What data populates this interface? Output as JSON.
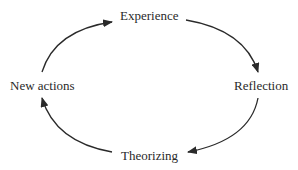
{
  "diagram": {
    "type": "cycle",
    "nodes": [
      {
        "id": "experience",
        "label": "Experience"
      },
      {
        "id": "reflection",
        "label": "Reflection"
      },
      {
        "id": "theorizing",
        "label": "Theorizing"
      },
      {
        "id": "new_actions",
        "label": "New actions"
      }
    ],
    "edges": [
      {
        "from": "experience",
        "to": "reflection"
      },
      {
        "from": "reflection",
        "to": "theorizing"
      },
      {
        "from": "theorizing",
        "to": "new_actions"
      },
      {
        "from": "new_actions",
        "to": "experience"
      }
    ],
    "colors": {
      "stroke": "#2a2a2a",
      "text": "#2a2a2a",
      "background": "#ffffff"
    }
  }
}
